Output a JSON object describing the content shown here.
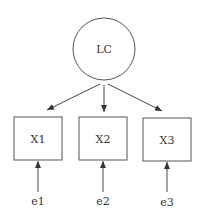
{
  "diagram": {
    "type": "path-diagram",
    "latent": {
      "id": "LC",
      "label": "LC",
      "cx": 104,
      "cy": 49,
      "r": 31
    },
    "indicators": [
      {
        "id": "X1",
        "label": "X1",
        "x": 14,
        "y": 117,
        "w": 48,
        "h": 43
      },
      {
        "id": "X2",
        "label": "X2",
        "x": 79,
        "y": 117,
        "w": 48,
        "h": 43
      },
      {
        "id": "X3",
        "label": "X3",
        "x": 143,
        "y": 118,
        "w": 48,
        "h": 43
      }
    ],
    "errors": [
      {
        "id": "e1",
        "label": "e1",
        "target": "X1"
      },
      {
        "id": "e2",
        "label": "e2",
        "target": "X2"
      },
      {
        "id": "e3",
        "label": "e3",
        "target": "X3"
      }
    ],
    "edges": [
      {
        "from": "LC",
        "to": "X1"
      },
      {
        "from": "LC",
        "to": "X2"
      },
      {
        "from": "LC",
        "to": "X3"
      },
      {
        "from": "e1",
        "to": "X1"
      },
      {
        "from": "e2",
        "to": "X2"
      },
      {
        "from": "e3",
        "to": "X3"
      }
    ],
    "colors": {
      "stroke": "#555555",
      "text": "#333333",
      "background": "#ffffff"
    }
  }
}
